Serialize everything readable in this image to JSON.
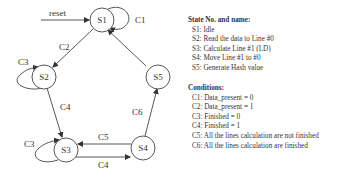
{
  "diagram": {
    "reset_label": "reset",
    "states": [
      {
        "id": "S1",
        "label": "S1"
      },
      {
        "id": "S2",
        "label": "S2"
      },
      {
        "id": "S3",
        "label": "S3"
      },
      {
        "id": "S4",
        "label": "S4"
      },
      {
        "id": "S5",
        "label": "S5"
      }
    ],
    "transitions": [
      {
        "from": "S1",
        "to": "S1",
        "label": "C1"
      },
      {
        "from": "S1",
        "to": "S2",
        "label": "C2"
      },
      {
        "from": "S2",
        "to": "S2",
        "label": "C3"
      },
      {
        "from": "S2",
        "to": "S3",
        "label": "C4"
      },
      {
        "from": "S3",
        "to": "S3",
        "label": "C3"
      },
      {
        "from": "S3",
        "to": "S4",
        "label": "C4"
      },
      {
        "from": "S4",
        "to": "S3",
        "label": "C5"
      },
      {
        "from": "S4",
        "to": "S5",
        "label": "C6"
      },
      {
        "from": "S5",
        "to": "S1",
        "label": ""
      }
    ]
  },
  "legend": {
    "states_title": "State No. and name:",
    "states": [
      "S1: Idle",
      "S2: Read the data to Line #0",
      "S3: Calculate Line #1 (LD)",
      "S4: Move Line #1 to #0",
      "S5: Generate Hash value"
    ],
    "conditions_title": "Conditions:",
    "conditions": [
      "C1: Data_present = 0",
      "C2: Data_present = 1",
      "C3: Finished = 0",
      "C4: Finished = 1",
      "C5: All the lines calculation are not finished",
      "C6: All the lines calculation are finished"
    ]
  }
}
